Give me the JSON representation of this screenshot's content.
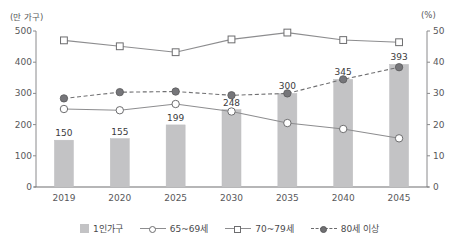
{
  "chart_data": {
    "type": "bar",
    "title": "",
    "categories": [
      "2019",
      "2020",
      "2025",
      "2030",
      "2035",
      "2040",
      "2045"
    ],
    "xlabel": "",
    "ylabel": "(만 가구)",
    "y2label": "(%)",
    "ylim": [
      0,
      500
    ],
    "y2lim": [
      0,
      50
    ],
    "yticks": [
      "0",
      "100",
      "200",
      "300",
      "400",
      "500"
    ],
    "y2ticks": [
      "0",
      "10",
      "20",
      "30",
      "40",
      "50"
    ],
    "grid": false,
    "legend_position": "bottom",
    "series": [
      {
        "name": "1인가구",
        "type": "bar",
        "axis": "left",
        "unit": "만 가구",
        "color": "#c3c3c5",
        "values": [
          150,
          155,
          199,
          248,
          300,
          345,
          393
        ],
        "labels": [
          "150",
          "155",
          "199",
          "248",
          "300",
          "345",
          "393"
        ]
      },
      {
        "name": "65~69세",
        "type": "line",
        "marker": "open-circle",
        "linestyle": "solid",
        "axis": "right",
        "unit": "%",
        "color": "#8d8d8f",
        "values": [
          25.0,
          24.6,
          26.6,
          24.2,
          20.5,
          18.6,
          15.6
        ]
      },
      {
        "name": "70~79세",
        "type": "line",
        "marker": "open-square",
        "linestyle": "solid",
        "axis": "right",
        "unit": "%",
        "color": "#8d8d8f",
        "values": [
          47.0,
          45.1,
          43.2,
          47.3,
          49.5,
          47.1,
          46.4
        ]
      },
      {
        "name": "80세 이상",
        "type": "line",
        "marker": "filled-circle",
        "linestyle": "dashed",
        "axis": "right",
        "unit": "%",
        "color": "#707072",
        "values": [
          28.4,
          30.4,
          30.6,
          29.4,
          30.0,
          34.5,
          38.4
        ]
      }
    ]
  },
  "legend": {
    "items": [
      {
        "label": "1인가구"
      },
      {
        "label": "65~69세"
      },
      {
        "label": "70~79세"
      },
      {
        "label": "80세 이상"
      }
    ]
  }
}
